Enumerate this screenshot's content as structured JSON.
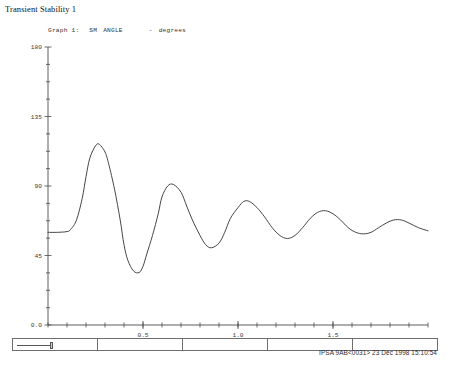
{
  "window": {
    "title": "Transient Stability 1"
  },
  "graph_caption": {
    "graph_label": "Graph 1:",
    "quantity": "SM",
    "variable": "ANGLE",
    "unit_separator": "-",
    "unit": "degrees"
  },
  "chart_data": {
    "type": "line",
    "subtitle": "",
    "xlabel": "",
    "ylabel": "degrees",
    "xlim": [
      0.0,
      2.0
    ],
    "ylim": [
      0.0,
      180.0
    ],
    "grid": false,
    "legend": "none",
    "x_ticks_major": [
      "0.5",
      "1.0",
      "1.5"
    ],
    "x_tick_major_values": [
      0.5,
      1.0,
      1.5
    ],
    "x_tick_minor_count": 20,
    "y_ticks": [
      "180",
      "135",
      "90",
      "45",
      "0.0"
    ],
    "y_tick_values": [
      180,
      135,
      90,
      45,
      0
    ],
    "y_tick_minor_count": 16,
    "series": [
      {
        "name": "SM ANGLE",
        "x": [
          0.0,
          0.05,
          0.1,
          0.12,
          0.15,
          0.18,
          0.2,
          0.22,
          0.25,
          0.27,
          0.3,
          0.32,
          0.35,
          0.38,
          0.4,
          0.42,
          0.45,
          0.48,
          0.5,
          0.52,
          0.55,
          0.58,
          0.6,
          0.63,
          0.66,
          0.7,
          0.73,
          0.76,
          0.8,
          0.83,
          0.86,
          0.9,
          0.93,
          0.96,
          1.0,
          1.03,
          1.06,
          1.1,
          1.14,
          1.18,
          1.22,
          1.26,
          1.3,
          1.34,
          1.38,
          1.42,
          1.46,
          1.5,
          1.54,
          1.58,
          1.62,
          1.66,
          1.7,
          1.74,
          1.78,
          1.82,
          1.86,
          1.9,
          1.95,
          2.0
        ],
        "y": [
          60,
          60,
          60.5,
          62,
          68,
          82,
          96,
          108,
          116,
          117,
          112,
          104,
          88,
          68,
          52,
          42,
          35,
          34,
          38,
          46,
          58,
          72,
          83,
          90,
          91,
          86,
          77,
          68,
          58,
          52,
          50,
          53,
          60,
          69,
          76,
          80,
          80,
          76,
          70,
          63,
          58,
          56,
          58,
          63,
          69,
          73,
          74,
          72,
          68,
          63,
          60,
          59,
          60,
          63,
          66,
          68,
          68,
          66,
          63,
          61
        ],
        "color": "#3c3c3c"
      }
    ]
  },
  "bottom_bar": {
    "segments": [
      "",
      "",
      "",
      "",
      ""
    ],
    "slider_present": true
  },
  "status": {
    "text": "IPSA 9AB<0031>  23 Dec 1998 15:10:54",
    "program": "IPSA",
    "case_id": "9AB<0031>",
    "date": "23 Dec 1998",
    "time": "15:10:54"
  }
}
